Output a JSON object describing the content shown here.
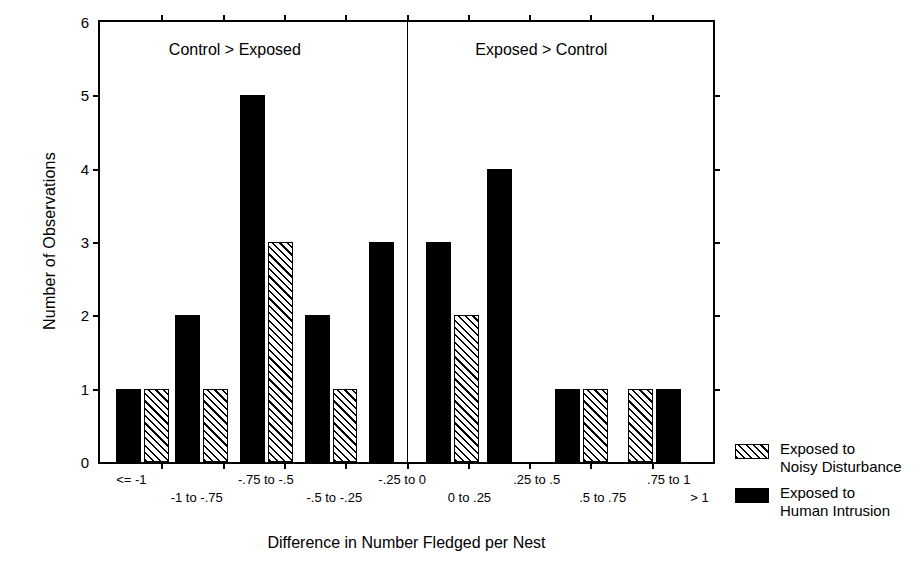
{
  "chart_data": {
    "type": "bar",
    "title": "",
    "xlabel": "Difference in Number Fledged per Nest",
    "ylabel": "Number of Observations",
    "ylim": [
      0,
      6
    ],
    "yticks": [
      "0",
      "1",
      "2",
      "3",
      "4",
      "5",
      "6"
    ],
    "grid": false,
    "legend_position": "right",
    "categories": [
      "<= -1",
      "-1 to -.75",
      "-.75 to -.5",
      "-.5 to -.25",
      "-.25 to 0",
      "0 to .25",
      ".25 to .5",
      ".5 to .75",
      ".75 to 1",
      "> 1"
    ],
    "category_label_rows": [
      {
        "text": "<= -1",
        "row": 0,
        "center_pct": 5.4
      },
      {
        "text": "-1 to -.75",
        "row": 1,
        "center_pct": 16.0
      },
      {
        "text": "-.75 to -.5",
        "row": 0,
        "center_pct": 27.2
      },
      {
        "text": "-.5 to -.25",
        "row": 1,
        "center_pct": 38.3
      },
      {
        "text": "-.25 to 0",
        "row": 0,
        "center_pct": 49.3
      },
      {
        "text": "0 to .25",
        "row": 1,
        "center_pct": 60.2
      },
      {
        "text": ".25 to .5",
        "row": 0,
        "center_pct": 71.1
      },
      {
        "text": ".5 to .75",
        "row": 1,
        "center_pct": 81.8
      },
      {
        "text": ".75 to 1",
        "row": 0,
        "center_pct": 92.5
      },
      {
        "text": "> 1",
        "row": 1,
        "center_pct": 97.5
      }
    ],
    "series": [
      {
        "name": "Exposed to Noisy Disturbance",
        "pattern": "hatched",
        "color": "#000000",
        "values": [
          1,
          1,
          3,
          1,
          0,
          2,
          0,
          1,
          1,
          0
        ]
      },
      {
        "name": "Exposed to Human Intrusion",
        "pattern": "solid",
        "color": "#000000",
        "values": [
          1,
          2,
          5,
          2,
          3,
          3,
          4,
          1,
          0,
          1
        ]
      }
    ],
    "bars": [
      {
        "series": "human",
        "value": 1,
        "left_pct": 2.6,
        "width_pct": 4.05
      },
      {
        "series": "noisy",
        "value": 1,
        "left_pct": 7.15,
        "width_pct": 4.05
      },
      {
        "series": "human",
        "value": 2,
        "left_pct": 12.3,
        "width_pct": 4.05
      },
      {
        "series": "noisy",
        "value": 1,
        "left_pct": 16.85,
        "width_pct": 4.05
      },
      {
        "series": "human",
        "value": 5,
        "left_pct": 22.85,
        "width_pct": 4.05
      },
      {
        "series": "noisy",
        "value": 3,
        "left_pct": 27.4,
        "width_pct": 4.05
      },
      {
        "series": "human",
        "value": 2,
        "left_pct": 33.4,
        "width_pct": 4.05
      },
      {
        "series": "noisy",
        "value": 1,
        "left_pct": 37.95,
        "width_pct": 4.05
      },
      {
        "series": "human",
        "value": 3,
        "left_pct": 43.9,
        "width_pct": 4.05
      },
      {
        "series": "human",
        "value": 3,
        "left_pct": 53.2,
        "width_pct": 4.05
      },
      {
        "series": "noisy",
        "value": 2,
        "left_pct": 57.75,
        "width_pct": 4.05
      },
      {
        "series": "human",
        "value": 4,
        "left_pct": 63.1,
        "width_pct": 4.05
      },
      {
        "series": "human",
        "value": 1,
        "left_pct": 74.2,
        "width_pct": 4.05
      },
      {
        "series": "noisy",
        "value": 1,
        "left_pct": 78.75,
        "width_pct": 4.05
      },
      {
        "series": "noisy",
        "value": 1,
        "left_pct": 86.2,
        "width_pct": 4.05
      },
      {
        "series": "human",
        "value": 1,
        "left_pct": 90.75,
        "width_pct": 4.05
      }
    ],
    "annotations": [
      {
        "text": "Control > Exposed",
        "x_pct": 22.0,
        "y_value": 5.62
      },
      {
        "text": "Exposed > Control",
        "x_pct": 72.0,
        "y_value": 5.62
      }
    ],
    "zero_divider_pct": 50.0,
    "xtick_positions_pct": [
      0,
      10.0,
      20.0,
      30.0,
      40.0,
      50.0,
      60.0,
      70.0,
      80.0,
      90.0,
      100.0
    ]
  },
  "legend": {
    "entries": [
      {
        "label": "Exposed to\nNoisy Disturbance",
        "swatch": "hatch"
      },
      {
        "label": "Exposed to\nHuman Intrusion",
        "swatch": "solid"
      }
    ]
  },
  "axis": {
    "y_title": "Number of Observations",
    "x_title": "Difference in Number Fledged per Nest",
    "y_tick_labels": [
      "6",
      "5",
      "4",
      "3",
      "2",
      "1",
      "0"
    ]
  },
  "regions": {
    "left_label": "Control > Exposed",
    "right_label": "Exposed > Control"
  }
}
